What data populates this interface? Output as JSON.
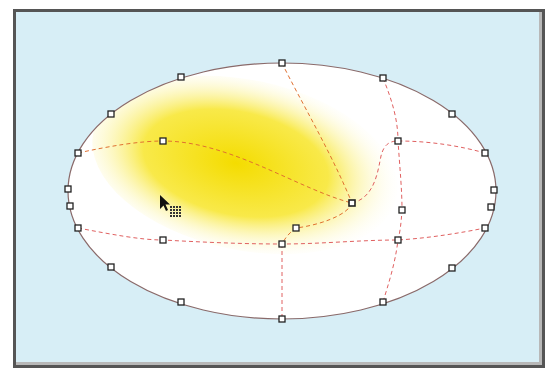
{
  "canvas": {
    "background": "#d7eef6",
    "frame_color": "#555555"
  },
  "gradient_mesh": {
    "shape": "ellipse",
    "outline_color": "#8a6a6a",
    "mesh_line_color": "#e06060",
    "fill_color": "#ffffff",
    "highlight_color": "#f5e000",
    "center": [
      282,
      191
    ],
    "radius_x": 214,
    "radius_y": 128,
    "selected_node": [
      352,
      203
    ],
    "outline_nodes": [
      [
        282,
        63
      ],
      [
        383,
        78
      ],
      [
        452,
        114
      ],
      [
        485,
        153
      ],
      [
        494,
        190
      ],
      [
        491,
        207
      ],
      [
        485,
        228
      ],
      [
        452,
        268
      ],
      [
        383,
        302
      ],
      [
        282,
        319
      ],
      [
        181,
        302
      ],
      [
        111,
        267
      ],
      [
        78,
        228
      ],
      [
        70,
        206
      ],
      [
        68,
        189
      ],
      [
        78,
        153
      ],
      [
        111,
        114
      ],
      [
        181,
        77
      ]
    ],
    "interior_nodes": [
      [
        163,
        141
      ],
      [
        398,
        141
      ],
      [
        402,
        210
      ],
      [
        163,
        240
      ],
      [
        282,
        244
      ],
      [
        398,
        240
      ],
      [
        296,
        228
      ]
    ]
  },
  "cursor": {
    "type": "mesh-tool-cursor"
  }
}
